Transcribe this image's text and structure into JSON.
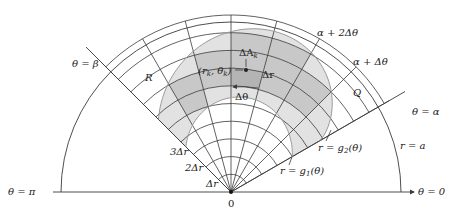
{
  "figure": {
    "colors": {
      "line": "#3a3a3a",
      "region_light": "#e2e2e2",
      "region_cell": "#c8c8c8",
      "highlight_cell": "#b4b4b4",
      "background": "#ffffff"
    },
    "geometry": {
      "origin": [
        231,
        192
      ],
      "outer_radius_a": 170,
      "grid_rings": 10,
      "delta_r_px": 17.7,
      "alpha_deg": 30,
      "beta_deg": 135,
      "delta_theta_deg": 15
    },
    "labels": {
      "theta_beta": "θ = β",
      "theta_alpha": "θ = α",
      "theta_pi": "θ = π",
      "theta_zero": "θ = 0",
      "origin": "0",
      "r_equals_a": "r = a",
      "alpha_plus_dtheta": "α + Δθ",
      "alpha_plus_2dtheta": "α + 2Δθ",
      "region": "R",
      "cell_q": "Q",
      "delta_a_k": "ΔA",
      "delta_a_k_sub": "k",
      "point": "(r",
      "point_sub1": "k",
      "point_mid": ", θ",
      "point_sub2": "k",
      "point_end": ")",
      "delta_r": "Δr",
      "delta_theta": "Δθ",
      "one_delta_r": "Δr",
      "two_delta_r": "2Δr",
      "three_delta_r": "3Δr",
      "g1": "r = g",
      "g1_sub": "1",
      "g1_end": "(θ)",
      "g2": "r = g",
      "g2_sub": "2",
      "g2_end": "(θ)"
    }
  }
}
